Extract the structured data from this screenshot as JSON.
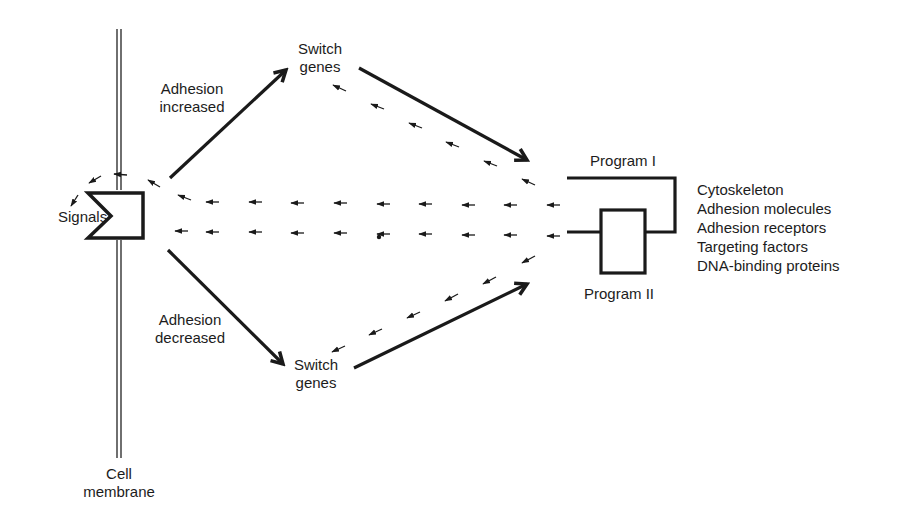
{
  "diagram": {
    "membrane_label_line1": "Cell",
    "membrane_label_line2": "membrane",
    "receptor_label": "Signals",
    "upper_arrow_label_line1": "Adhesion",
    "upper_arrow_label_line2": "increased",
    "lower_arrow_label_line1": "Adhesion",
    "lower_arrow_label_line2": "decreased",
    "upper_switch_line1": "Switch",
    "upper_switch_line2": "genes",
    "lower_switch_line1": "Switch",
    "lower_switch_line2": "genes",
    "program1_label": "Program I",
    "program2_label": "Program II",
    "outputs": [
      "Cytoskeleton",
      "Adhesion molecules",
      "Adhesion receptors",
      "Targeting factors",
      "DNA-binding proteins"
    ],
    "colors": {
      "ink": "#1a1a1a",
      "background": "#ffffff"
    }
  }
}
